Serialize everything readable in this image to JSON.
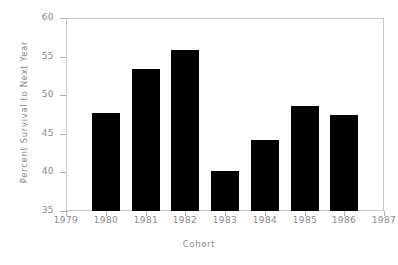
{
  "chart_data": {
    "type": "bar",
    "title": "",
    "xlabel": "Cohort",
    "ylabel": "Percent Survival to Next Year",
    "categories": [
      "1980",
      "1981",
      "1982",
      "1983",
      "1984",
      "1985",
      "1986"
    ],
    "values": [
      47.7,
      53.4,
      55.8,
      40.2,
      44.2,
      48.6,
      47.4
    ],
    "ylim": [
      35,
      60
    ],
    "xlim": [
      1979,
      1987
    ],
    "ytick_labels": [
      "35",
      "40",
      "45",
      "50",
      "55",
      "60"
    ],
    "ytick_values": [
      35,
      40,
      45,
      50,
      55,
      60
    ],
    "xtick_labels": [
      "1979",
      "1980",
      "1981",
      "1982",
      "1983",
      "1984",
      "1985",
      "1986",
      "1987"
    ],
    "xtick_values": [
      1979,
      1980,
      1981,
      1982,
      1983,
      1984,
      1985,
      1986,
      1987
    ],
    "grid": false,
    "legend": "none",
    "bar_color": "#000000",
    "axis_color": "#c9c9c9",
    "text_color": "#8a8a8a",
    "background": "#ffffff"
  }
}
